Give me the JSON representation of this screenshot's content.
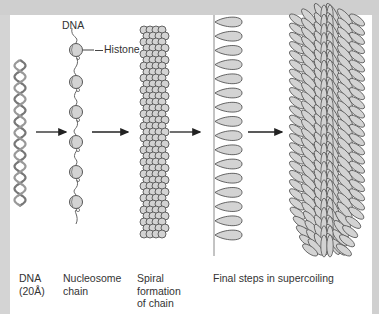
{
  "figure": {
    "title_labels": {
      "dna_top": "DNA",
      "histone": "Histone"
    },
    "stages": [
      {
        "id": "dna",
        "lines": [
          "DNA",
          "(20Å)"
        ],
        "x": 19
      },
      {
        "id": "nucleosome",
        "lines": [
          "Nucleosome",
          "chain"
        ],
        "x": 63
      },
      {
        "id": "spiral",
        "lines": [
          "Spiral",
          "formation",
          "of chain"
        ],
        "x": 137
      },
      {
        "id": "supercoil",
        "lines": [
          "Final steps in supercoiling"
        ],
        "x": 213
      }
    ],
    "arrows": [
      {
        "x1": 36,
        "x2": 66,
        "y": 132
      },
      {
        "x1": 92,
        "x2": 128,
        "y": 132
      },
      {
        "x1": 170,
        "x2": 200,
        "y": 132
      },
      {
        "x1": 248,
        "x2": 282,
        "y": 132
      }
    ],
    "colors": {
      "frame": "#d0d0d0",
      "panel": "#ffffff",
      "fill": "#d3d3d3",
      "stroke": "#555555",
      "text": "#333333"
    }
  }
}
